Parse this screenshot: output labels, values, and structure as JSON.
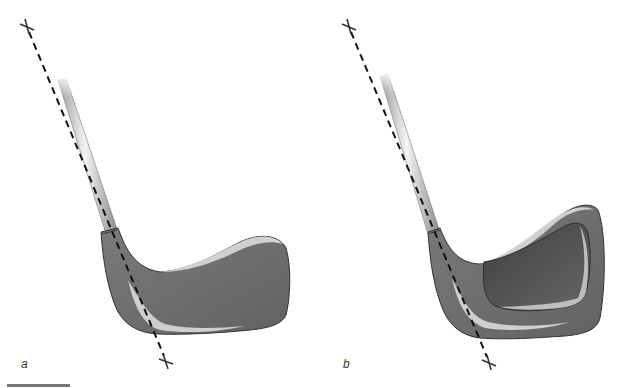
{
  "figure": {
    "panels": [
      {
        "id": "a",
        "label": "a",
        "description": "Golf iron clubhead, solid back (muscle back)",
        "shaft_axis": {
          "top_marker": [
            27,
            27
          ],
          "bottom_marker": [
            166,
            362
          ]
        }
      },
      {
        "id": "b",
        "label": "b",
        "description": "Golf iron clubhead, cavity back",
        "shaft_axis": {
          "top_marker": [
            349,
            27
          ],
          "bottom_marker": [
            489,
            363
          ]
        }
      }
    ],
    "scale_bar": {
      "visible": true
    },
    "colors": {
      "head_fill": "#6e6e6e",
      "head_edge": "#333333",
      "highlight": "#c8c8c8",
      "cavity": "#505050",
      "shaft_light": "#f2f2f2",
      "shaft_dark": "#9a9a9a",
      "axis_line": "#111111"
    }
  }
}
